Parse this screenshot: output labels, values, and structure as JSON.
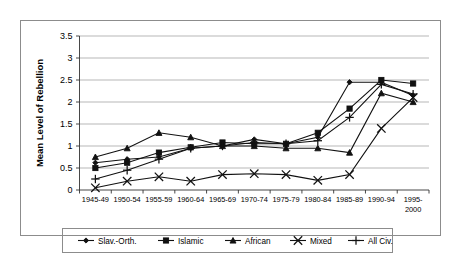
{
  "chart_data": {
    "type": "line",
    "title": "",
    "xlabel": "",
    "ylabel": "Mean Level of Rebellion",
    "ylim": [
      0,
      3.5
    ],
    "ytick_labels": [
      "0",
      "0.5",
      "1",
      "1.5",
      "2",
      "2.5",
      "3",
      "3.5"
    ],
    "ytick_values": [
      0,
      0.5,
      1,
      1.5,
      2,
      2.5,
      3,
      3.5
    ],
    "grid": true,
    "legend_position": "bottom",
    "categories": [
      "1945-49",
      "1950-54",
      "1955-59",
      "1960-64",
      "1965-69",
      "1970-74",
      "1975-79",
      "1980-84",
      "1985-89",
      "1990-94",
      "1995-2000"
    ],
    "categories_multiline": [
      [
        "1945-49"
      ],
      [
        "1950-54"
      ],
      [
        "1955-59"
      ],
      [
        "1960-64"
      ],
      [
        "1965-69"
      ],
      [
        "1970-74"
      ],
      [
        "1975-79"
      ],
      [
        "1980-84"
      ],
      [
        "1985-89"
      ],
      [
        "1990-94"
      ],
      [
        "1995-",
        "2000"
      ]
    ],
    "series": [
      {
        "name": "Slav.-Orth.",
        "marker": "diamond",
        "values": [
          0.62,
          0.7,
          0.75,
          0.95,
          1.0,
          1.15,
          1.05,
          1.2,
          2.45,
          2.45,
          2.15
        ]
      },
      {
        "name": "Islamic",
        "marker": "square",
        "values": [
          0.5,
          0.62,
          0.85,
          0.97,
          1.08,
          1.05,
          1.05,
          1.3,
          1.85,
          2.5,
          2.42
        ]
      },
      {
        "name": "African",
        "marker": "triangle",
        "values": [
          0.75,
          0.95,
          1.3,
          1.2,
          1.0,
          1.0,
          0.95,
          0.95,
          0.85,
          2.2,
          2.0
        ]
      },
      {
        "name": "Mixed",
        "marker": "cross-x",
        "values": [
          0.05,
          0.2,
          0.3,
          0.2,
          0.35,
          0.37,
          0.35,
          0.22,
          0.35,
          1.4,
          2.1
        ]
      },
      {
        "name": "All Civ.",
        "marker": "plus",
        "values": [
          0.25,
          0.45,
          0.7,
          0.95,
          1.0,
          1.08,
          1.05,
          1.12,
          1.65,
          2.4,
          2.18
        ]
      }
    ]
  },
  "legend": {
    "items": [
      {
        "label": "Slav.-Orth."
      },
      {
        "label": "Islamic"
      },
      {
        "label": "African"
      },
      {
        "label": "Mixed"
      },
      {
        "label": "All Civ."
      }
    ]
  },
  "colors": {
    "ink": "#111111",
    "grid": "#9a9a9a",
    "frame": "#8c8c8c",
    "background": "#ffffff"
  }
}
